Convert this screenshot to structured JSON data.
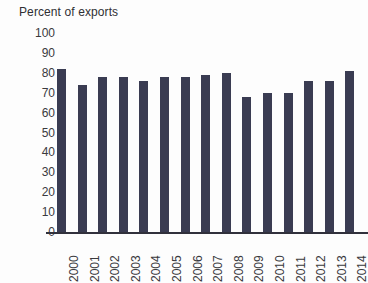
{
  "chart_data": {
    "type": "bar",
    "title": "Percent of exports",
    "subtitle": "",
    "xlabel": "",
    "ylabel": "Percent of exports",
    "ylim": [
      0,
      100
    ],
    "ytick_labels": [
      "100",
      "90",
      "80",
      "70",
      "60",
      "50",
      "40",
      "30",
      "20",
      "10",
      "0"
    ],
    "ytick_values": [
      100,
      90,
      80,
      70,
      60,
      50,
      40,
      30,
      20,
      10,
      0
    ],
    "grid": false,
    "legend": null,
    "legend_position": "none",
    "bar_color": "#3a3c52",
    "axis_color": "#31313c",
    "text_color": "#3a3a3e",
    "categories": [
      "2000",
      "2001",
      "2002",
      "2003",
      "2004",
      "2005",
      "2006",
      "2007",
      "2008",
      "2009",
      "2010",
      "2011",
      "2012",
      "2013",
      "2014"
    ],
    "values": [
      82,
      74,
      78,
      78,
      76,
      78,
      78,
      79,
      80,
      68,
      70,
      70,
      76,
      76,
      81
    ]
  }
}
